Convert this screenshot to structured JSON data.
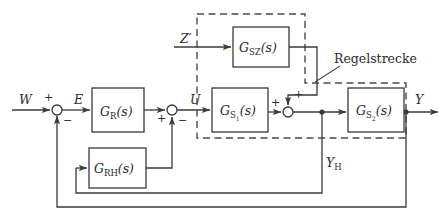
{
  "diagram": {
    "line_color": "#3a3a3a",
    "dash_color": "#4a4a4a",
    "text_color": "#2b2b2b",
    "blocks": [
      {
        "id": "controller",
        "name": "G_R(s)",
        "base": "G",
        "sub": "R",
        "arg": "(s)",
        "x": 92,
        "y": 88,
        "w": 52,
        "h": 44
      },
      {
        "id": "aux-controller",
        "name": "G_RH(s)",
        "base": "G",
        "sub": "RH",
        "arg": "(s)",
        "x": 89,
        "y": 148,
        "w": 57,
        "h": 40
      },
      {
        "id": "disturbance-path",
        "name": "G_SZ(s)",
        "base": "G",
        "sub": "SZ",
        "arg": "(s)",
        "x": 233,
        "y": 27,
        "w": 56,
        "h": 40
      },
      {
        "id": "plant-part-1",
        "name": "G_S1(s)",
        "base": "G",
        "sub": "S",
        "subsub": "1",
        "arg": "(s)",
        "x": 212,
        "y": 88,
        "w": 56,
        "h": 44
      },
      {
        "id": "plant-part-2",
        "name": "G_S2(s)",
        "base": "G",
        "sub": "S",
        "subsub": "2",
        "arg": "(s)",
        "x": 348,
        "y": 88,
        "w": 56,
        "h": 44
      }
    ],
    "summing_junctions": [
      {
        "id": "error-junction",
        "cx": 57,
        "cy": 110,
        "r": 5,
        "signs": [
          {
            "text": "+",
            "x": 44,
            "y": 101
          },
          {
            "text": "−",
            "x": 63,
            "y": 124
          }
        ]
      },
      {
        "id": "aux-junction",
        "cx": 172,
        "cy": 110,
        "r": 5,
        "signs": [
          {
            "text": "+",
            "x": 157,
            "y": 122
          },
          {
            "text": "−",
            "x": 178,
            "y": 124
          }
        ]
      },
      {
        "id": "disturbance-junction",
        "cx": 288,
        "cy": 112,
        "r": 5,
        "signs": [
          {
            "text": "+",
            "x": 294,
            "y": 98
          },
          {
            "text": "+",
            "x": 271,
            "y": 106
          }
        ]
      }
    ],
    "signals": [
      {
        "id": "reference",
        "text": "W",
        "x": 19,
        "y": 104,
        "italic": true
      },
      {
        "id": "error",
        "text": "E",
        "x": 74,
        "y": 104,
        "italic": true
      },
      {
        "id": "control",
        "text": "U",
        "x": 190,
        "y": 104,
        "italic": true
      },
      {
        "id": "disturbance",
        "text": "Z′",
        "x": 180,
        "y": 43,
        "italic": true
      },
      {
        "id": "output",
        "text": "Y",
        "x": 415,
        "y": 104,
        "italic": true
      },
      {
        "id": "aux-output",
        "base": "Y",
        "sub": "H",
        "x": 326,
        "y": 167,
        "italic": true
      }
    ],
    "annotation": {
      "id": "plant-annotation",
      "text": "Regelstrecke",
      "x": 334,
      "y": 63
    },
    "dashed_region": {
      "id": "plant-boundary",
      "label": "Regelstrecke",
      "points": "197,14 305,14 305,83 406,83 406,138 197,138"
    }
  }
}
